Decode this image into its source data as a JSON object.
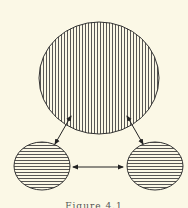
{
  "figure": {
    "caption": "Figure 4.1",
    "background": "#fbf8e6",
    "stroke_color": "#333333",
    "nodes": [
      {
        "id": "top",
        "cx": 99,
        "cy": 78,
        "rx": 60,
        "ry": 56,
        "hatch": "vertical"
      },
      {
        "id": "left",
        "cx": 42,
        "cy": 166,
        "rx": 28,
        "ry": 24,
        "hatch": "horizontal"
      },
      {
        "id": "right",
        "cx": 155,
        "cy": 166,
        "rx": 28,
        "ry": 24,
        "hatch": "horizontal"
      }
    ],
    "edges": [
      {
        "from": "top",
        "to": "left",
        "bidirectional": true
      },
      {
        "from": "top",
        "to": "right",
        "bidirectional": true
      },
      {
        "from": "left",
        "to": "right",
        "bidirectional": true
      }
    ]
  }
}
